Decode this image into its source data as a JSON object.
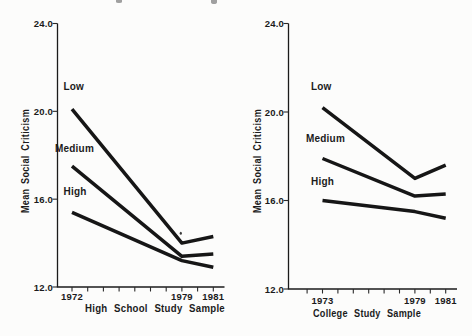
{
  "figure": {
    "ink_color": "#1b1b1b",
    "paper_color": "#fcfcfb"
  },
  "chart_data": [
    {
      "type": "line",
      "panel": "highschool",
      "title": "",
      "xlabel": "High School Study Sample",
      "ylabel": "Mean Social Criticism",
      "x": [
        1972,
        1979,
        1981
      ],
      "x_tick_labels": [
        "1972",
        "1979",
        "1981"
      ],
      "x_minor_ticks": [
        1972,
        1973,
        1974,
        1975,
        1976,
        1977,
        1978,
        1979,
        1980,
        1981
      ],
      "y_ticks": [
        24.0,
        20.0,
        16.0,
        12.0
      ],
      "y_tick_labels": [
        "24.0",
        "20.0",
        "16.0",
        "12.0"
      ],
      "ylim": [
        12.0,
        24.0
      ],
      "grid": false,
      "legend": "inline-labels",
      "series": [
        {
          "name": "Low",
          "values": [
            20.1,
            14.0,
            14.3
          ]
        },
        {
          "name": "Medium",
          "values": [
            17.5,
            13.4,
            13.5
          ]
        },
        {
          "name": "High",
          "values": [
            15.4,
            13.2,
            12.9
          ]
        }
      ]
    },
    {
      "type": "line",
      "panel": "college",
      "title": "",
      "xlabel": "College Study Sample",
      "ylabel": "Mean Social Criticism",
      "x": [
        1973,
        1979,
        1981
      ],
      "x_tick_labels": [
        "1973",
        "1979",
        "1981"
      ],
      "x_minor_ticks": [
        1972,
        1973,
        1974,
        1975,
        1976,
        1977,
        1978,
        1979,
        1980,
        1981
      ],
      "y_ticks": [
        24.0,
        20.0,
        16.0,
        12.0
      ],
      "y_tick_labels": [
        "24.0",
        "20.0",
        "16.0",
        "12.0"
      ],
      "ylim": [
        12.0,
        24.0
      ],
      "grid": false,
      "legend": "inline-labels",
      "series": [
        {
          "name": "Low",
          "values": [
            20.2,
            17.0,
            17.6
          ]
        },
        {
          "name": "Medium",
          "values": [
            17.9,
            16.2,
            16.3
          ]
        },
        {
          "name": "High",
          "values": [
            16.0,
            15.5,
            15.2
          ]
        }
      ]
    }
  ]
}
